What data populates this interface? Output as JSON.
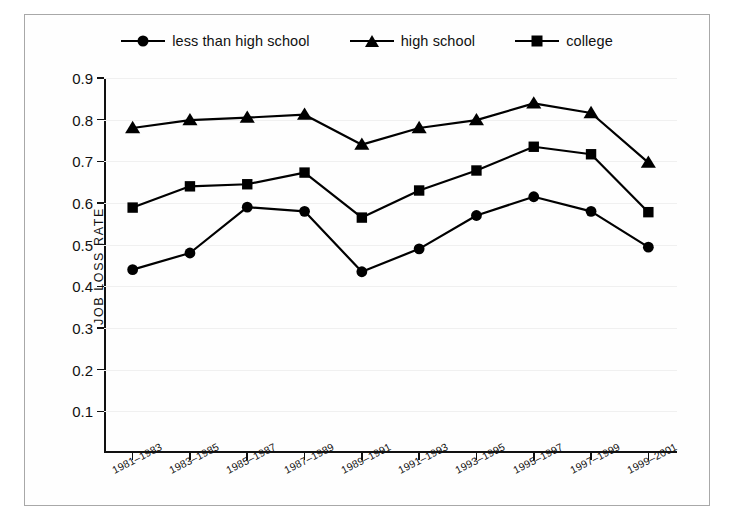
{
  "chart_data": {
    "type": "line",
    "title": "",
    "xlabel": "",
    "ylabel": "JOB LOSS RATE",
    "ylim": [
      0,
      0.9
    ],
    "yticks": [
      0.1,
      0.2,
      0.3,
      0.4,
      0.5,
      0.6,
      0.7,
      0.8,
      0.9
    ],
    "ytick_labels": [
      "0.1",
      "0.2",
      "0.3",
      "0.4",
      "0.5",
      "0.6",
      "0.7",
      "0.8",
      "0.9"
    ],
    "grid": true,
    "legend_position": "top",
    "categories": [
      "1981–1983",
      "1983–1985",
      "1985–1987",
      "1987–1989",
      "1989–1991",
      "1991–1993",
      "1993–1995",
      "1995–1997",
      "1997–1999",
      "1999–2001"
    ],
    "series": [
      {
        "name": "less than high school",
        "marker": "circle",
        "color": "#000000",
        "values": [
          0.44,
          0.48,
          0.59,
          0.58,
          0.435,
          0.49,
          0.57,
          0.615,
          0.58,
          0.494
        ]
      },
      {
        "name": "high school",
        "marker": "triangle",
        "color": "#000000",
        "values": [
          0.78,
          0.799,
          0.805,
          0.812,
          0.74,
          0.78,
          0.799,
          0.839,
          0.816,
          0.697
        ]
      },
      {
        "name": "college",
        "marker": "square",
        "color": "#000000",
        "values": [
          0.589,
          0.64,
          0.645,
          0.673,
          0.565,
          0.63,
          0.678,
          0.735,
          0.717,
          0.578
        ]
      }
    ]
  },
  "legend": {
    "items": [
      {
        "label": "less than high school",
        "marker": "circle"
      },
      {
        "label": "high school",
        "marker": "triangle"
      },
      {
        "label": "college",
        "marker": "square"
      }
    ]
  }
}
